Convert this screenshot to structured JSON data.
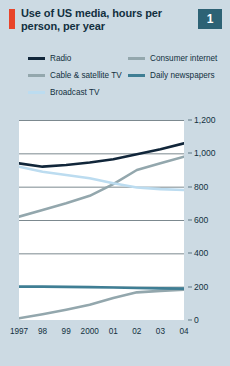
{
  "header": {
    "title": "Use of US media, hours per person, per year",
    "badge": "1",
    "accent_color": "#e8442a",
    "badge_color": "#2d6275"
  },
  "legend": {
    "position": "top",
    "entries": [
      {
        "label": "Radio",
        "color": "#11263a",
        "column": 0,
        "row": 0
      },
      {
        "label": "Cable & satellite TV",
        "color": "#93a7ad",
        "column": 0,
        "row": 1
      },
      {
        "label": "Broadcast TV",
        "color": "#bcdcf0",
        "column": 0,
        "row": 2
      },
      {
        "label": "Consumer internet",
        "color": "#93a7ad",
        "column": 1,
        "row": 0
      },
      {
        "label": "Daily newspapers",
        "color": "#3f7e94",
        "column": 1,
        "row": 1
      }
    ]
  },
  "chart_data": {
    "type": "line",
    "title": "Use of US media, hours per person, per year",
    "xlabel": "",
    "ylabel": "",
    "x": [
      1997,
      1998,
      1999,
      2000,
      2001,
      2002,
      2003,
      2004
    ],
    "categories": [
      "1997",
      "98",
      "99",
      "2000",
      "01",
      "02",
      "03",
      "04"
    ],
    "ylim": [
      0,
      1200
    ],
    "yticks": [
      0,
      200,
      400,
      600,
      800,
      1000,
      1200
    ],
    "ytick_labels": [
      "0",
      "200",
      "400",
      "600",
      "800",
      "1,000",
      "1,200"
    ],
    "y_axis_side": "right",
    "grid": true,
    "grid_color": "#6d7c82",
    "plot_background": "#ffffff",
    "series": [
      {
        "name": "Radio",
        "color": "#11263a",
        "width": 2.6,
        "values": [
          940,
          920,
          930,
          945,
          965,
          995,
          1025,
          1060
        ]
      },
      {
        "name": "Cable & satellite TV",
        "color": "#93a7ad",
        "width": 2.6,
        "values": [
          620,
          660,
          700,
          745,
          815,
          900,
          940,
          980
        ]
      },
      {
        "name": "Broadcast TV",
        "color": "#bcdcf0",
        "width": 2.6,
        "values": [
          920,
          890,
          870,
          850,
          820,
          795,
          785,
          780
        ]
      },
      {
        "name": "Consumer internet",
        "color": "#93a7ad",
        "width": 2.6,
        "values": [
          10,
          35,
          62,
          92,
          132,
          166,
          175,
          182
        ]
      },
      {
        "name": "Daily newspapers",
        "color": "#3f7e94",
        "width": 2.6,
        "values": [
          200,
          200,
          199,
          197,
          195,
          192,
          190,
          188
        ]
      }
    ]
  }
}
